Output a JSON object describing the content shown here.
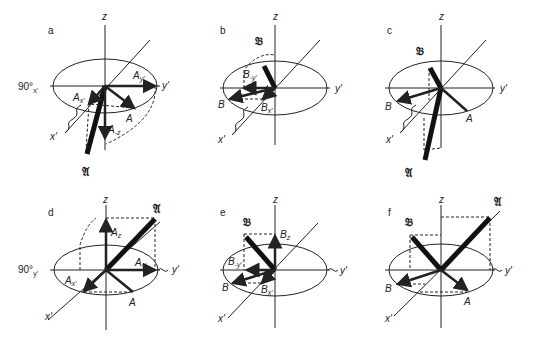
{
  "figure": {
    "panels": [
      {
        "id": "a",
        "label": "a",
        "rotation_label": "90°",
        "rotation_sub": "x'",
        "axes": {
          "z": "z",
          "y": "y'",
          "x": "x'"
        },
        "vectors": [
          "A",
          "𝔄"
        ],
        "components": [
          "A_x'",
          "A_y'",
          "A_-z"
        ]
      },
      {
        "id": "b",
        "label": "b",
        "axes": {
          "z": "z",
          "y": "y'",
          "x": "x'"
        },
        "vectors": [
          "B",
          "𝔅"
        ],
        "components": [
          "B_-y'",
          "B_x'"
        ]
      },
      {
        "id": "c",
        "label": "c",
        "axes": {
          "z": "z",
          "y": "y'",
          "x": "x'"
        },
        "vectors": [
          "A",
          "B",
          "𝔄",
          "𝔅"
        ]
      },
      {
        "id": "d",
        "label": "d",
        "rotation_label": "90°",
        "rotation_sub": "y'",
        "axes": {
          "z": "z",
          "y": "y'",
          "x": "x'"
        },
        "vectors": [
          "A",
          "𝔄"
        ],
        "components": [
          "A_z",
          "A_x'",
          "A_y'"
        ]
      },
      {
        "id": "e",
        "label": "e",
        "axes": {
          "z": "z",
          "y": "y'",
          "x": "x'"
        },
        "vectors": [
          "B",
          "𝔅"
        ],
        "components": [
          "B_z",
          "B_-y'",
          "B_x'"
        ]
      },
      {
        "id": "f",
        "label": "f",
        "axes": {
          "z": "z",
          "y": "y'",
          "x": "x'"
        },
        "vectors": [
          "A",
          "B",
          "𝔄",
          "𝔅"
        ]
      }
    ],
    "text": {
      "a": "a",
      "b": "b",
      "c": "c",
      "d": "d",
      "e": "e",
      "f": "f",
      "z": "z",
      "y": "y'",
      "x": "x'",
      "deg90": "90°",
      "subx": "x'",
      "suby": "y'",
      "A": "A",
      "B": "B",
      "Afrak": "𝔄",
      "Bfrak": "𝔅",
      "Ax": "A",
      "Ax_sub": "x'",
      "Ay": "A",
      "Ay_sub": "y'",
      "Amz": "A",
      "Amz_sub": "-z",
      "Az": "A",
      "Az_sub": "z",
      "Bmy": "B",
      "Bmy_sub": "-y'",
      "Bx": "B",
      "Bx_sub": "x'",
      "Bz": "B",
      "Bz_sub": "z"
    }
  }
}
